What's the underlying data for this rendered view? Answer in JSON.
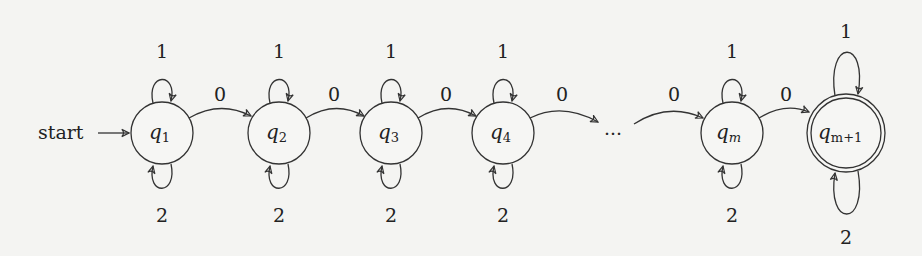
{
  "diagram": {
    "type": "finite-automaton",
    "start_label": "start",
    "ellipsis": "···",
    "states": [
      {
        "id": "q1",
        "base": "q",
        "sub": "1",
        "cx": 162,
        "cy": 133,
        "accepting": false,
        "start": true
      },
      {
        "id": "q2",
        "base": "q",
        "sub": "2",
        "cx": 279,
        "cy": 133,
        "accepting": false
      },
      {
        "id": "q3",
        "base": "q",
        "sub": "3",
        "cx": 391,
        "cy": 133,
        "accepting": false
      },
      {
        "id": "q4",
        "base": "q",
        "sub": "4",
        "cx": 503,
        "cy": 133,
        "accepting": false
      },
      {
        "id": "qm",
        "base": "q",
        "sub": "m",
        "cx": 732,
        "cy": 133,
        "accepting": false
      },
      {
        "id": "qm+1",
        "base": "q",
        "sub": "m+1",
        "cx": 846,
        "cy": 133,
        "accepting": true
      }
    ],
    "transitions": [
      {
        "from": "q1",
        "to": "q1",
        "label": "1",
        "position": "above"
      },
      {
        "from": "q1",
        "to": "q1",
        "label": "2",
        "position": "below"
      },
      {
        "from": "q1",
        "to": "q2",
        "label": "0"
      },
      {
        "from": "q2",
        "to": "q2",
        "label": "1",
        "position": "above"
      },
      {
        "from": "q2",
        "to": "q2",
        "label": "2",
        "position": "below"
      },
      {
        "from": "q2",
        "to": "q3",
        "label": "0"
      },
      {
        "from": "q3",
        "to": "q3",
        "label": "1",
        "position": "above"
      },
      {
        "from": "q3",
        "to": "q3",
        "label": "2",
        "position": "below"
      },
      {
        "from": "q3",
        "to": "q4",
        "label": "0"
      },
      {
        "from": "q4",
        "to": "q4",
        "label": "1",
        "position": "above"
      },
      {
        "from": "q4",
        "to": "q4",
        "label": "2",
        "position": "below"
      },
      {
        "from": "q4",
        "to": "...",
        "label": "0"
      },
      {
        "from": "...",
        "to": "qm",
        "label": "0"
      },
      {
        "from": "qm",
        "to": "qm",
        "label": "1",
        "position": "above"
      },
      {
        "from": "qm",
        "to": "qm",
        "label": "2",
        "position": "below"
      },
      {
        "from": "qm",
        "to": "qm+1",
        "label": "0"
      },
      {
        "from": "qm+1",
        "to": "qm+1",
        "label": "1",
        "position": "above"
      },
      {
        "from": "qm+1",
        "to": "qm+1",
        "label": "2",
        "position": "below"
      }
    ]
  }
}
